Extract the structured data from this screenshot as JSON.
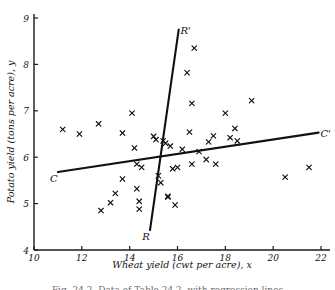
{
  "figure": {
    "caption": "Fig. 24.2. Data of Table 24.2, with regression lines"
  },
  "chart_data": {
    "type": "scatter",
    "title": "",
    "xlabel": "Wheat yield (cwt per acre), x",
    "ylabel": "Potato yield (tons per acre), y",
    "xlim": [
      10,
      22
    ],
    "ylim": [
      4,
      9
    ],
    "xticks": [
      10,
      12,
      14,
      16,
      18,
      20,
      22
    ],
    "yticks": [
      4,
      5,
      6,
      7,
      8,
      9
    ],
    "xtick_labels": [
      "10",
      "12",
      "14",
      "16",
      "18",
      "20",
      "22"
    ],
    "ytick_labels": [
      "4",
      "5",
      "6",
      "7",
      "8",
      "9"
    ],
    "grid": false,
    "legend": "none",
    "marker": "x",
    "x": [
      11.2,
      11.9,
      12.7,
      12.8,
      13.2,
      13.4,
      13.7,
      13.7,
      14.1,
      14.2,
      14.3,
      14.3,
      14.4,
      14.4,
      14.5,
      15.0,
      15.1,
      15.2,
      15.3,
      15.4,
      15.5,
      15.6,
      15.6,
      15.7,
      15.8,
      15.9,
      16.0,
      16.2,
      16.4,
      16.5,
      16.6,
      16.6,
      16.7,
      16.9,
      17.2,
      17.3,
      17.5,
      17.6,
      18.0,
      18.2,
      18.4,
      18.5,
      19.1,
      20.5,
      21.5
    ],
    "y": [
      6.6,
      6.5,
      6.72,
      4.85,
      5.02,
      5.22,
      6.52,
      5.53,
      6.95,
      6.2,
      5.85,
      5.32,
      5.05,
      4.88,
      5.78,
      6.45,
      6.38,
      5.6,
      5.45,
      6.35,
      6.3,
      5.14,
      5.16,
      6.24,
      5.75,
      4.97,
      5.78,
      6.17,
      7.82,
      6.54,
      7.16,
      5.85,
      8.35,
      6.12,
      5.95,
      6.33,
      6.46,
      5.85,
      6.95,
      6.42,
      6.62,
      6.35,
      7.22,
      5.57,
      5.78
    ],
    "lines": [
      {
        "name": "regression-of-y-on-x",
        "label_start": "C",
        "label_end": "C'",
        "x_start": 11.0,
        "y_start": 5.68,
        "x_end": 21.9,
        "y_end": 6.53
      },
      {
        "name": "regression-of-x-on-y",
        "label_start": "R",
        "label_end": "R'",
        "x_start": 14.85,
        "y_start": 4.43,
        "x_end": 16.05,
        "y_end": 8.75
      }
    ]
  }
}
